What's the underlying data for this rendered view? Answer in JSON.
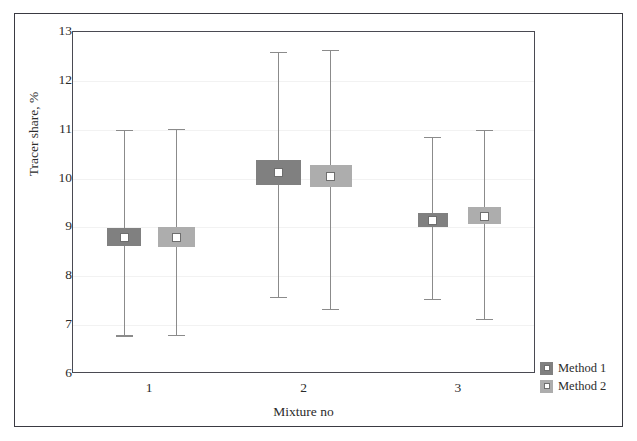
{
  "chart_data": {
    "type": "bar",
    "title": "",
    "xlabel": "Mixture no",
    "ylabel": "Tracer share, %",
    "categories": [
      "1",
      "2",
      "3"
    ],
    "xtick_labels": [
      "1",
      "2",
      "3"
    ],
    "ytick_labels": [
      "13",
      "12",
      "11",
      "10",
      "9",
      "8",
      "7",
      "6"
    ],
    "ylim": [
      6,
      13
    ],
    "grid": true,
    "legend_position": "right-bottom-outside",
    "series": [
      {
        "name": "Method 1",
        "color": "#808080",
        "values": [
          8.8,
          10.12,
          9.14
        ],
        "box_low": [
          8.62,
          9.87,
          9.0
        ],
        "box_high": [
          8.98,
          10.37,
          9.3
        ],
        "whisker_low": [
          6.79,
          7.58,
          7.54
        ],
        "whisker_high": [
          11.0,
          12.6,
          10.85
        ]
      },
      {
        "name": "Method 2",
        "color": "#adadad",
        "values": [
          8.8,
          10.04,
          9.23
        ],
        "box_low": [
          8.6,
          9.82,
          9.08
        ],
        "box_high": [
          9.0,
          10.28,
          9.42
        ],
        "whisker_low": [
          6.8,
          7.34,
          7.12
        ],
        "whisker_high": [
          11.02,
          12.64,
          11.0
        ]
      }
    ]
  },
  "legend": {
    "entries": [
      {
        "label": "Method 1",
        "color": "#808080"
      },
      {
        "label": "Method 2",
        "color": "#adadad"
      }
    ]
  },
  "axes": {
    "y_title": "Tracer share, %",
    "x_title": "Mixture no"
  }
}
